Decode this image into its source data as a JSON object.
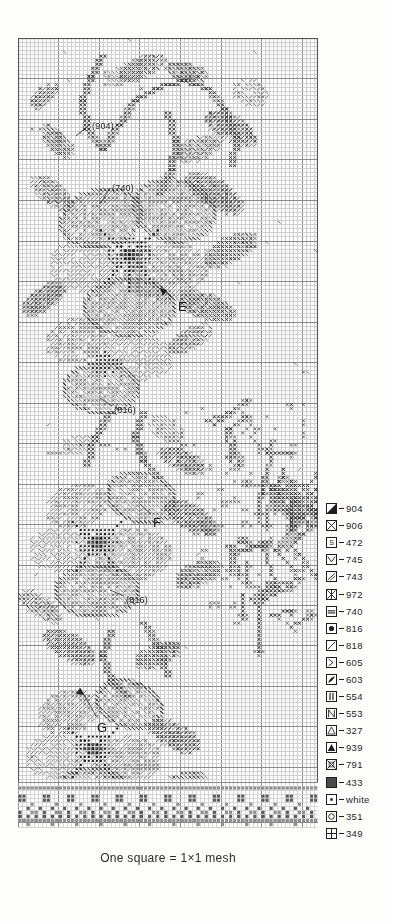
{
  "caption": "One square = 1×1 mesh",
  "chart": {
    "annotations": [
      {
        "id": "code-904",
        "text": "(904)",
        "x": 74,
        "y": 84,
        "kind": "code"
      },
      {
        "id": "code-740",
        "text": "(740)",
        "x": 94,
        "y": 146,
        "kind": "code"
      },
      {
        "id": "letter-e",
        "text": "E",
        "x": 160,
        "y": 262,
        "kind": "letter"
      },
      {
        "id": "code-816-upper",
        "text": "(816)",
        "x": 96,
        "y": 368,
        "kind": "code"
      },
      {
        "id": "letter-f",
        "text": "F",
        "x": 135,
        "y": 478,
        "kind": "letter"
      },
      {
        "id": "code-816-lower",
        "text": "(816)",
        "x": 108,
        "y": 558,
        "kind": "code"
      },
      {
        "id": "letter-g",
        "text": "G",
        "x": 79,
        "y": 683,
        "kind": "letter"
      }
    ]
  },
  "legend": {
    "separator": "–",
    "items": [
      {
        "symbol": "half-filled-triangle",
        "color_code": "904"
      },
      {
        "symbol": "cross-in-box",
        "color_code": "906"
      },
      {
        "symbol": "letter-s",
        "color_code": "472"
      },
      {
        "symbol": "chevron-down",
        "color_code": "745"
      },
      {
        "symbol": "diagonal-slash-pair",
        "color_code": "743"
      },
      {
        "symbol": "star-asterisk",
        "color_code": "972"
      },
      {
        "symbol": "equals-bar",
        "color_code": "740"
      },
      {
        "symbol": "filled-circle",
        "color_code": "816"
      },
      {
        "symbol": "diagonal-line",
        "color_code": "818"
      },
      {
        "symbol": "arrow-right",
        "color_code": "605"
      },
      {
        "symbol": "leaf-swirl",
        "color_code": "603"
      },
      {
        "symbol": "double-vertical-bars",
        "color_code": "554"
      },
      {
        "symbol": "backslash-n",
        "color_code": "553"
      },
      {
        "symbol": "open-triangle",
        "color_code": "327"
      },
      {
        "symbol": "filled-triangle",
        "color_code": "939"
      },
      {
        "symbol": "boxed-x",
        "color_code": "791"
      },
      {
        "symbol": "solid-square",
        "color_code": "433"
      },
      {
        "symbol": "center-dot",
        "color_code": "white"
      },
      {
        "symbol": "open-circle",
        "color_code": "351"
      },
      {
        "symbol": "plus-cross",
        "color_code": "349"
      }
    ]
  },
  "chart_data": {
    "type": "heatmap",
    "xlabel": "",
    "ylabel": "",
    "grid": true,
    "cell_size_px": 4.05,
    "columns": 74,
    "rows": 195,
    "legend_position": "right",
    "categories": [
      "904",
      "906",
      "472",
      "745",
      "743",
      "972",
      "740",
      "816",
      "818",
      "605",
      "603",
      "554",
      "553",
      "327",
      "939",
      "791",
      "433",
      "white",
      "351",
      "349"
    ],
    "values": [
      20,
      18,
      14,
      12,
      16,
      10,
      11,
      22,
      15,
      9,
      8,
      13,
      12,
      17,
      19,
      7,
      10,
      6,
      12,
      11
    ],
    "annotations": [
      "(904)",
      "(740)",
      "E",
      "(816)",
      "F",
      "(816)",
      "G"
    ]
  }
}
